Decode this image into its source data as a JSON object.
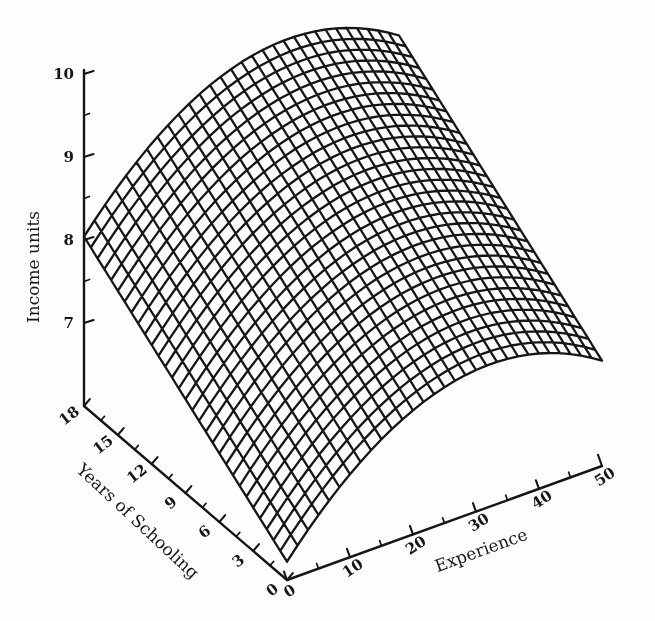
{
  "figure": {
    "background": "#fefefe",
    "ink": "#161616"
  },
  "chart_data": {
    "type": "surface",
    "title": "",
    "z_axis": {
      "label": "Income units",
      "ticks": [
        10,
        9,
        8,
        7
      ],
      "range": [
        6,
        10
      ],
      "minor_ticks": [
        9.5,
        8.5,
        7.5
      ]
    },
    "y_axis": {
      "label": "Years of Schooling",
      "ticks": [
        18,
        15,
        12,
        9,
        6,
        3,
        0
      ],
      "range": [
        0,
        18
      ],
      "minor_ticks": [
        16.5,
        13.5,
        10.5,
        7.5,
        4.5,
        1.5
      ]
    },
    "x_axis": {
      "label": "Experience",
      "ticks": [
        0,
        10,
        20,
        30,
        40,
        50
      ],
      "range": [
        0,
        50
      ],
      "minor_ticks": [
        5,
        15,
        25,
        35,
        45
      ]
    },
    "surface": {
      "model": "income = 6.22 + 0.1011*schooling + 0.0923*experience - 0.001426*experience^2",
      "coefficients": {
        "intercept": 6.22,
        "schooling": 0.1011,
        "experience": 0.0923,
        "experience_sq": -0.001426
      },
      "mesh_divisions": {
        "schooling": 30,
        "experience": 30
      },
      "income_at_ticks": {
        "schooling": [
          0,
          3,
          6,
          9,
          12,
          15,
          18
        ],
        "experience": [
          0,
          10,
          20,
          30,
          40,
          50
        ],
        "income": [
          [
            6.22,
            7.0,
            7.5,
            7.71,
            7.63,
            7.27
          ],
          [
            6.52,
            7.3,
            7.8,
            8.01,
            7.93,
            7.57
          ],
          [
            6.83,
            7.61,
            8.1,
            8.31,
            8.24,
            7.88
          ],
          [
            7.13,
            7.91,
            8.41,
            8.62,
            8.54,
            8.18
          ],
          [
            7.43,
            8.21,
            8.71,
            8.92,
            8.84,
            8.48
          ],
          [
            7.74,
            8.52,
            9.01,
            9.22,
            9.15,
            8.79
          ],
          [
            8.04,
            8.82,
            9.32,
            9.53,
            9.45,
            9.09
          ]
        ]
      }
    }
  }
}
